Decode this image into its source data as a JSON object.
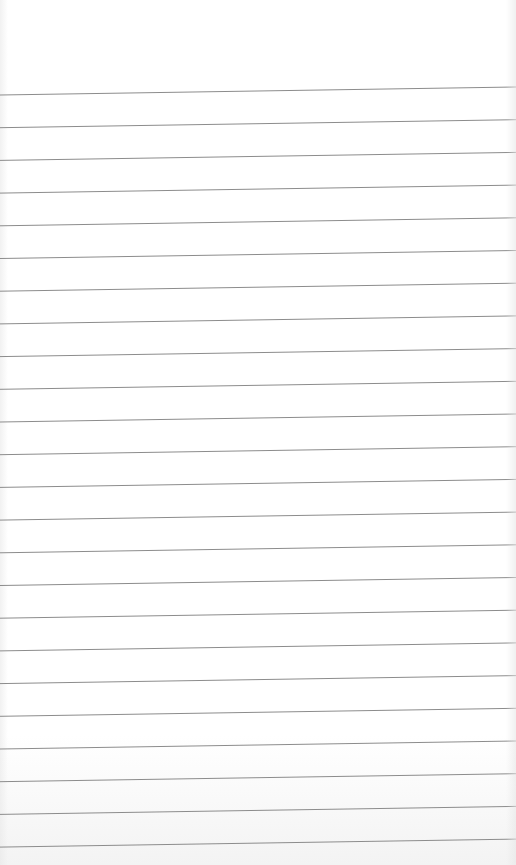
{
  "page": {
    "type": "lined-paper",
    "background_color": "#ffffff",
    "line_color": "#8c8c8c"
  },
  "lines": {
    "count": 24,
    "first_left_y": 95,
    "spacing": 32.7,
    "rise_across_width": 8
  }
}
